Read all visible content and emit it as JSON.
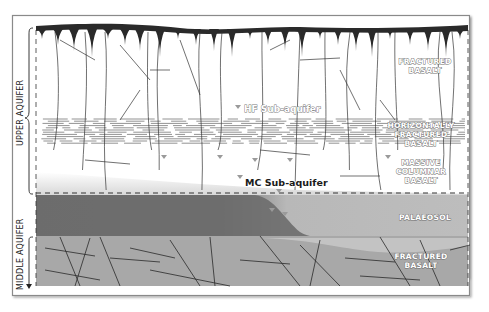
{
  "diagram": {
    "side_labels": {
      "upper": "UPPER AQUIFER",
      "middle": "MIDDLE AQUIFER"
    },
    "layer_labels": [
      {
        "key": "fractured_basalt_top",
        "lines": [
          "FRACTURED",
          "BASALT"
        ]
      },
      {
        "key": "horizontally_fractured",
        "lines": [
          "HORIZONTALLY",
          "FRACTURED",
          "BASALT"
        ]
      },
      {
        "key": "massive_columnar",
        "lines": [
          "MASSIVE",
          "COLUMNAR",
          "BASALT"
        ]
      },
      {
        "key": "palaeosol",
        "lines": [
          "PALAEOSOL"
        ]
      },
      {
        "key": "fractured_basalt_bottom",
        "lines": [
          "FRACTURED",
          "BASALT"
        ]
      }
    ],
    "sub_aquifers": {
      "hf": "HF Sub-aquifer",
      "mc": "MC Sub-aquifer"
    },
    "colors": {
      "frame": "#8a8a8a",
      "crust": "#2a2a2a",
      "palaeosol_dark": "#6e6e6e",
      "palaeosol_light": "#b9b9b9",
      "lower_basalt": "#a9a9a9",
      "water_marker": "#9a9a9a"
    }
  }
}
